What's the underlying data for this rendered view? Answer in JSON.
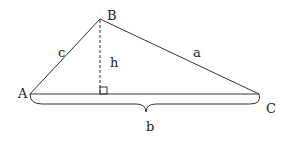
{
  "diagram": {
    "type": "triangle-with-altitude",
    "vertices": {
      "A": {
        "label": "A",
        "x": 30,
        "y": 94
      },
      "B": {
        "label": "B",
        "x": 100,
        "y": 19
      },
      "C": {
        "label": "C",
        "x": 259,
        "y": 94
      }
    },
    "sides": {
      "a": {
        "label": "a",
        "between": [
          "B",
          "C"
        ]
      },
      "b": {
        "label": "b",
        "between": [
          "A",
          "C"
        ]
      },
      "c": {
        "label": "c",
        "between": [
          "A",
          "B"
        ]
      }
    },
    "altitude": {
      "label": "h",
      "from": "B",
      "foot_x": 100,
      "foot_y": 94,
      "style": "dashed",
      "right_angle_marker": true
    },
    "brace": {
      "under": "b"
    },
    "stroke_color": "#333333"
  },
  "labels": {
    "A": "A",
    "B": "B",
    "C": "C",
    "a": "a",
    "b": "b",
    "c": "c",
    "h": "h"
  }
}
